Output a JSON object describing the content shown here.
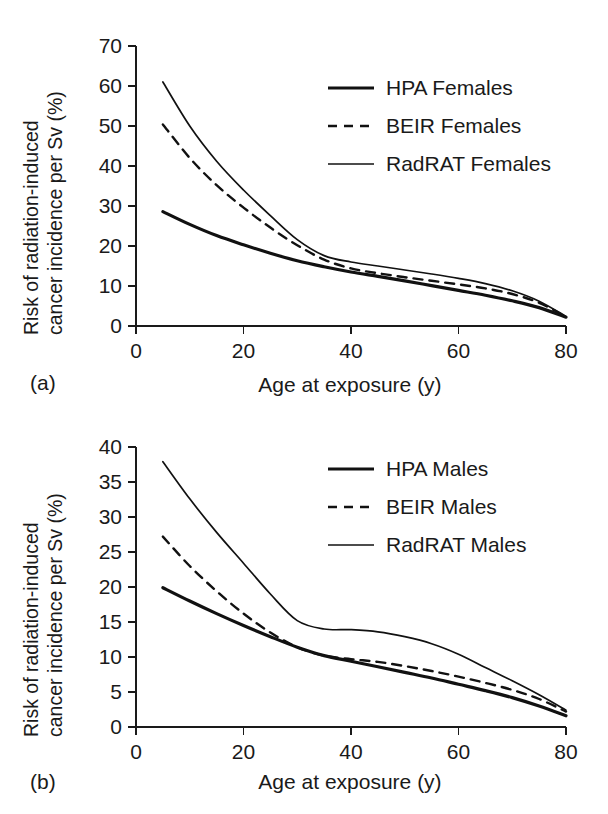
{
  "figure": {
    "background_color": "#ffffff",
    "line_color": "#111111",
    "text_color": "#1a1a1a"
  },
  "panels": [
    {
      "id": "a",
      "panel_label": "(a)",
      "xlabel": "Age at exposure (y)",
      "ylabel_line1": "Risk of radiation-induced",
      "ylabel_line2": "cancer incidence per Sv (%)",
      "x_ticks": [
        "0",
        "20",
        "40",
        "60",
        "80"
      ],
      "y_ticks": [
        "0",
        "10",
        "20",
        "30",
        "40",
        "50",
        "60",
        "70"
      ],
      "legend": [
        {
          "label": "HPA Females",
          "style": "solid-thick"
        },
        {
          "label": "BEIR Females",
          "style": "dashed"
        },
        {
          "label": "RadRAT Females",
          "style": "solid-thin"
        }
      ]
    },
    {
      "id": "b",
      "panel_label": "(b)",
      "xlabel": "Age at exposure (y)",
      "ylabel_line1": "Risk of radiation-induced",
      "ylabel_line2": "cancer incidence per Sv (%)",
      "x_ticks": [
        "0",
        "20",
        "40",
        "60",
        "80"
      ],
      "y_ticks": [
        "0",
        "5",
        "10",
        "15",
        "20",
        "25",
        "30",
        "35",
        "40"
      ],
      "legend": [
        {
          "label": "HPA Males",
          "style": "solid-thick"
        },
        {
          "label": "BEIR Males",
          "style": "dashed"
        },
        {
          "label": "RadRAT Males",
          "style": "solid-thin"
        }
      ]
    }
  ],
  "chart_data": [
    {
      "type": "line",
      "panel": "a",
      "title": "",
      "xlabel": "Age at exposure (y)",
      "ylabel": "Risk of radiation-induced cancer incidence per Sv (%)",
      "xlim": [
        0,
        80
      ],
      "ylim": [
        0,
        70
      ],
      "xticks": [
        0,
        20,
        40,
        60,
        80
      ],
      "yticks": [
        0,
        10,
        20,
        30,
        40,
        50,
        60,
        70
      ],
      "grid": false,
      "legend_position": "upper right",
      "x": [
        5,
        10,
        15,
        20,
        25,
        30,
        35,
        40,
        45,
        50,
        55,
        60,
        65,
        70,
        75,
        80
      ],
      "series": [
        {
          "name": "HPA Females",
          "style": "solid-thick",
          "values": [
            28.6,
            25.4,
            22.6,
            20.3,
            18.2,
            16.3,
            14.8,
            13.5,
            12.4,
            11.3,
            10.1,
            8.9,
            7.7,
            6.3,
            4.6,
            2.2
          ]
        },
        {
          "name": "BEIR Females",
          "style": "dashed",
          "values": [
            50.4,
            42.0,
            35.2,
            29.6,
            24.6,
            20.2,
            16.6,
            14.4,
            13.2,
            12.2,
            11.3,
            10.4,
            9.4,
            8.0,
            5.8,
            2.3
          ]
        },
        {
          "name": "RadRAT Females",
          "style": "solid-thin",
          "values": [
            61.0,
            50.0,
            41.2,
            34.0,
            27.6,
            21.6,
            17.6,
            16.0,
            15.0,
            14.0,
            13.0,
            11.9,
            10.6,
            8.8,
            6.2,
            2.4
          ]
        }
      ]
    },
    {
      "type": "line",
      "panel": "b",
      "title": "",
      "xlabel": "Age at exposure (y)",
      "ylabel": "Risk of radiation-induced cancer incidence per Sv (%)",
      "xlim": [
        0,
        80
      ],
      "ylim": [
        0,
        40
      ],
      "xticks": [
        0,
        20,
        40,
        60,
        80
      ],
      "yticks": [
        0,
        5,
        10,
        15,
        20,
        25,
        30,
        35,
        40
      ],
      "grid": false,
      "legend_position": "upper right",
      "x": [
        5,
        10,
        15,
        20,
        25,
        30,
        35,
        40,
        45,
        50,
        55,
        60,
        65,
        70,
        75,
        80
      ],
      "series": [
        {
          "name": "HPA Males",
          "style": "solid-thick",
          "values": [
            19.9,
            18.0,
            16.2,
            14.5,
            12.9,
            11.4,
            10.2,
            9.4,
            8.6,
            7.8,
            7.0,
            6.1,
            5.2,
            4.2,
            3.0,
            1.6
          ]
        },
        {
          "name": "BEIR Males",
          "style": "dashed",
          "values": [
            27.2,
            23.0,
            19.4,
            16.2,
            13.5,
            11.4,
            10.2,
            9.7,
            9.3,
            8.7,
            8.0,
            7.2,
            6.3,
            5.3,
            4.0,
            2.2
          ]
        },
        {
          "name": "RadRAT Males",
          "style": "solid-thin",
          "values": [
            37.9,
            32.6,
            27.8,
            23.4,
            19.0,
            15.2,
            14.0,
            13.9,
            13.6,
            12.9,
            11.9,
            10.4,
            8.5,
            6.6,
            4.6,
            2.4
          ]
        }
      ]
    }
  ]
}
